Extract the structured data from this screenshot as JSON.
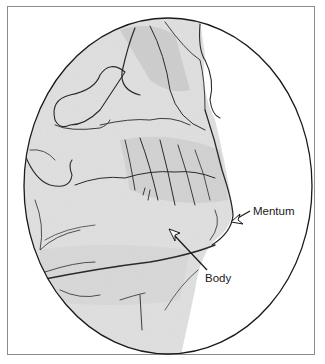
{
  "figure": {
    "type": "anatomical-illustration",
    "labels": [
      {
        "id": "mentum",
        "text": "Mentum"
      },
      {
        "id": "body",
        "text": "Body"
      }
    ],
    "colors": {
      "line": "#1a1a1a",
      "shading": "#d9d9d9",
      "frame": "#8c8c8c",
      "background": "#ffffff"
    }
  }
}
